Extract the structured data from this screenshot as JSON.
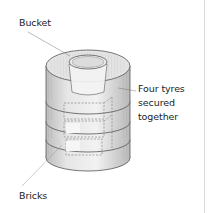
{
  "diagram": {
    "labels": {
      "bucket": "Bucket",
      "tyres_line1": "Four tyres",
      "tyres_line2": "secured",
      "tyres_line3": "together",
      "bricks": "Bricks"
    },
    "colors": {
      "outline": "#555555",
      "shade": "#cfcfcf",
      "light": "#ececec",
      "label_text": "#222222",
      "leader_line": "#777777"
    }
  }
}
